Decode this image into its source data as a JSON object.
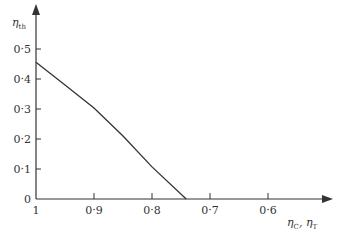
{
  "chart_data": {
    "type": "line",
    "title": "",
    "xlabel": "ηC, ηT",
    "ylabel": "ηth",
    "x_reversed": true,
    "xlim": [
      1.0,
      0.52
    ],
    "ylim": [
      0,
      0.55
    ],
    "grid": false,
    "legend": null,
    "x_ticks": [
      {
        "value": 1.0,
        "label": "1"
      },
      {
        "value": 0.9,
        "label": "0·9"
      },
      {
        "value": 0.8,
        "label": "0·8"
      },
      {
        "value": 0.7,
        "label": "0·7"
      },
      {
        "value": 0.6,
        "label": "0·6"
      }
    ],
    "y_ticks": [
      {
        "value": 0.0,
        "label": "0"
      },
      {
        "value": 0.1,
        "label": "0·1"
      },
      {
        "value": 0.2,
        "label": "0·2"
      },
      {
        "value": 0.3,
        "label": "0·3"
      },
      {
        "value": 0.4,
        "label": "0·4"
      },
      {
        "value": 0.5,
        "label": "0·5"
      }
    ],
    "series": [
      {
        "name": "ηth",
        "x": [
          1.0,
          0.95,
          0.9,
          0.85,
          0.8,
          0.741
        ],
        "values": [
          0.456,
          0.38,
          0.303,
          0.21,
          0.107,
          0.0
        ]
      }
    ]
  },
  "labels": {
    "y_axis_main": "η",
    "y_axis_sub": "th",
    "x_axis_main1": "η",
    "x_axis_sub1": "C",
    "x_axis_sep": ", ",
    "x_axis_main2": "η",
    "x_axis_sub2": "T"
  },
  "colors": {
    "line": "#333333",
    "axis": "#333333",
    "background": "#ffffff"
  }
}
